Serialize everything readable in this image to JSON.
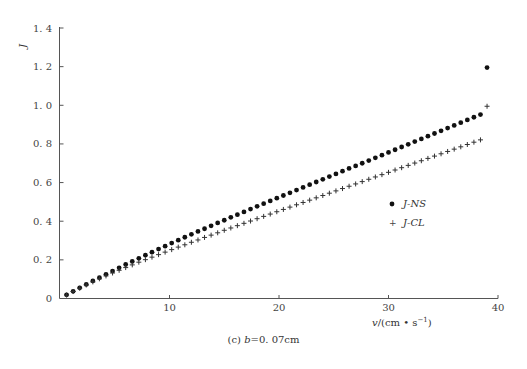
{
  "chart_data": {
    "type": "scatter",
    "title": "",
    "caption": "(c) b=0.07cm",
    "xlabel": "v/(cm • s⁻¹)",
    "ylabel": "J",
    "xlim": [
      0,
      40
    ],
    "ylim": [
      0,
      1.4
    ],
    "xticks": [
      10,
      20,
      30,
      40
    ],
    "yticks": [
      0,
      0.2,
      0.4,
      0.6,
      0.8,
      1.0,
      1.2,
      1.4
    ],
    "ytick_labels": [
      "0",
      "0.2",
      "0.4",
      "0.6",
      "0.8",
      "1.0",
      "1.2",
      "1.4"
    ],
    "xtick_labels": [
      "0",
      "10",
      "20",
      "30",
      "40"
    ],
    "grid": false,
    "legend_position": "right-middle",
    "series": [
      {
        "name": "J-NS",
        "marker": "circle",
        "x": [
          0.6,
          1.2,
          1.8,
          2.4,
          3.0,
          3.6,
          4.2,
          4.8,
          5.4,
          6.0,
          6.6,
          7.2,
          7.8,
          8.4,
          9.0,
          9.6,
          10.2,
          10.8,
          11.4,
          12.0,
          12.6,
          13.2,
          13.8,
          14.4,
          15.0,
          15.6,
          16.2,
          16.8,
          17.4,
          18.0,
          18.6,
          19.2,
          19.8,
          20.4,
          21.0,
          21.6,
          22.2,
          22.8,
          23.4,
          24.0,
          24.6,
          25.2,
          25.8,
          26.4,
          27.0,
          27.6,
          28.2,
          28.8,
          29.4,
          30.0,
          30.6,
          31.2,
          31.8,
          32.4,
          33.0,
          33.6,
          34.2,
          34.8,
          35.4,
          36.0,
          36.6,
          37.2,
          37.8,
          38.4,
          39.0
        ],
        "y": [
          0.019,
          0.037,
          0.055,
          0.073,
          0.091,
          0.108,
          0.125,
          0.142,
          0.159,
          0.176,
          0.192,
          0.208,
          0.224,
          0.24,
          0.256,
          0.271,
          0.287,
          0.302,
          0.317,
          0.332,
          0.347,
          0.361,
          0.376,
          0.391,
          0.405,
          0.42,
          0.434,
          0.448,
          0.463,
          0.477,
          0.491,
          0.505,
          0.519,
          0.533,
          0.547,
          0.561,
          0.575,
          0.589,
          0.603,
          0.617,
          0.631,
          0.645,
          0.659,
          0.673,
          0.686,
          0.7,
          0.714,
          0.728,
          0.742,
          0.756,
          0.77,
          0.784,
          0.798,
          0.812,
          0.826,
          0.84,
          0.854,
          0.868,
          0.882,
          0.896,
          0.91,
          0.924,
          0.938,
          0.952,
          1.195
        ]
      },
      {
        "name": "J-CL",
        "marker": "plus",
        "x": [
          0.6,
          1.2,
          1.8,
          2.4,
          3.0,
          3.6,
          4.2,
          4.8,
          5.4,
          6.0,
          6.6,
          7.2,
          7.8,
          8.4,
          9.0,
          9.6,
          10.2,
          10.8,
          11.4,
          12.0,
          12.6,
          13.2,
          13.8,
          14.4,
          15.0,
          15.6,
          16.2,
          16.8,
          17.4,
          18.0,
          18.6,
          19.2,
          19.8,
          20.4,
          21.0,
          21.6,
          22.2,
          22.8,
          23.4,
          24.0,
          24.6,
          25.2,
          25.8,
          26.4,
          27.0,
          27.6,
          28.2,
          28.8,
          29.4,
          30.0,
          30.6,
          31.2,
          31.8,
          32.4,
          33.0,
          33.6,
          34.2,
          34.8,
          35.4,
          36.0,
          36.6,
          37.2,
          37.8,
          38.4,
          39.0
        ],
        "y": [
          0.018,
          0.036,
          0.053,
          0.07,
          0.086,
          0.102,
          0.117,
          0.132,
          0.146,
          0.16,
          0.174,
          0.188,
          0.201,
          0.214,
          0.227,
          0.24,
          0.253,
          0.266,
          0.278,
          0.291,
          0.303,
          0.316,
          0.328,
          0.34,
          0.353,
          0.365,
          0.377,
          0.389,
          0.401,
          0.413,
          0.425,
          0.437,
          0.449,
          0.461,
          0.473,
          0.485,
          0.497,
          0.509,
          0.521,
          0.533,
          0.545,
          0.557,
          0.569,
          0.581,
          0.593,
          0.605,
          0.617,
          0.629,
          0.641,
          0.653,
          0.665,
          0.677,
          0.689,
          0.701,
          0.713,
          0.725,
          0.737,
          0.749,
          0.761,
          0.773,
          0.785,
          0.797,
          0.809,
          0.821,
          0.995
        ]
      }
    ]
  },
  "legend": {
    "items": [
      {
        "label": "J-NS",
        "marker": "●"
      },
      {
        "label": "J-CL",
        "marker": "+"
      }
    ]
  },
  "axes": {
    "y_label": "J",
    "x_label_prefix": "v",
    "x_label_units": "/(cm • s",
    "x_label_exp": "−1",
    "x_label_close": ")"
  },
  "caption": {
    "prefix": "(c) ",
    "var": "b",
    "rest": "=0. 07cm"
  }
}
